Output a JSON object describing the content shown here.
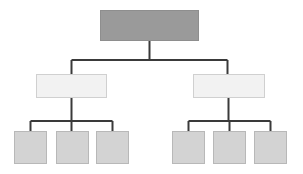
{
  "diagram": {
    "type": "tree-hierarchy",
    "title": "",
    "width": 303,
    "height": 174,
    "background_color": "#ffffff",
    "orientation": "top-down",
    "connector": {
      "color": "#3a3a3a",
      "width": 2,
      "style": "orthogonal-elbow"
    },
    "levels": 3,
    "node_count": 9,
    "styles": {
      "root": {
        "fill": "#9a9a9a",
        "stroke": "#8e8e8e",
        "stroke_width": 1
      },
      "branch": {
        "fill": "#f2f2f2",
        "stroke": "#d0d0d0",
        "stroke_width": 1
      },
      "leaf": {
        "fill": "#d3d3d3",
        "stroke": "#b8b8b8",
        "stroke_width": 1
      }
    },
    "nodes": [
      {
        "id": "root",
        "label": "",
        "level": 0,
        "style": "root",
        "x": 100,
        "y": 10,
        "w": 99,
        "h": 31
      },
      {
        "id": "branch-left",
        "label": "",
        "level": 1,
        "style": "branch",
        "x": 36,
        "y": 74,
        "w": 71,
        "h": 24
      },
      {
        "id": "branch-right",
        "label": "",
        "level": 1,
        "style": "branch",
        "x": 193,
        "y": 74,
        "w": 72,
        "h": 24
      },
      {
        "id": "leaf-left-1",
        "label": "",
        "level": 2,
        "style": "leaf",
        "x": 14,
        "y": 131,
        "w": 33,
        "h": 33
      },
      {
        "id": "leaf-left-2",
        "label": "",
        "level": 2,
        "style": "leaf",
        "x": 56,
        "y": 131,
        "w": 33,
        "h": 33
      },
      {
        "id": "leaf-left-3",
        "label": "",
        "level": 2,
        "style": "leaf",
        "x": 96,
        "y": 131,
        "w": 33,
        "h": 33
      },
      {
        "id": "leaf-right-1",
        "label": "",
        "level": 2,
        "style": "leaf",
        "x": 172,
        "y": 131,
        "w": 33,
        "h": 33
      },
      {
        "id": "leaf-right-2",
        "label": "",
        "level": 2,
        "style": "leaf",
        "x": 213,
        "y": 131,
        "w": 33,
        "h": 33
      },
      {
        "id": "leaf-right-3",
        "label": "",
        "level": 2,
        "style": "leaf",
        "x": 254,
        "y": 131,
        "w": 33,
        "h": 33
      }
    ],
    "edges": [
      {
        "from": "root",
        "to": "branch-left"
      },
      {
        "from": "root",
        "to": "branch-right"
      },
      {
        "from": "branch-left",
        "to": "leaf-left-1"
      },
      {
        "from": "branch-left",
        "to": "leaf-left-2"
      },
      {
        "from": "branch-left",
        "to": "leaf-left-3"
      },
      {
        "from": "branch-right",
        "to": "leaf-right-1"
      },
      {
        "from": "branch-right",
        "to": "leaf-right-2"
      },
      {
        "from": "branch-right",
        "to": "leaf-right-3"
      }
    ],
    "connector_paths": {
      "root_stem": "M149.5,41 L149.5,60",
      "root_bus": "M71.5,60 L227.5,60",
      "branch_left_riser": "M71.5,60 L71.5,74",
      "branch_right_riser": "M227.5,60 L227.5,74",
      "branch_left_stem": "M71.5,98 L71.5,121",
      "branch_left_bus": "M30.5,121 L112.5,121",
      "branch_left_drop_1": "M30.5,121 L30.5,131",
      "branch_left_drop_2": "M71.5,121 L71.5,131",
      "branch_left_drop_3": "M112.5,121 L112.5,131",
      "branch_right_stem": "M228.5,98 L228.5,121",
      "branch_right_bus": "M188.5,121 L270.5,121",
      "branch_right_drop_1": "M188.5,121 L188.5,131",
      "branch_right_drop_2": "M229.5,121 L229.5,131",
      "branch_right_drop_3": "M270.5,121 L270.5,131"
    }
  }
}
